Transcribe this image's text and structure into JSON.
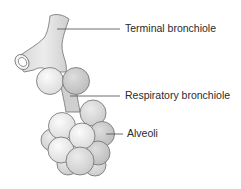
{
  "diagram": {
    "labels": [
      {
        "id": "terminal-bronchiole",
        "text": "Terminal bronchiole"
      },
      {
        "id": "respiratory-bronchiole",
        "text": "Respiratory bronchiole"
      },
      {
        "id": "alveoli",
        "text": "Alveoli"
      }
    ],
    "colors": {
      "outline": "#6e6e6e",
      "fill_light": "#f2f2f2",
      "fill_mid": "#dcdcdc",
      "fill_dark": "#c4c4c4",
      "leader_line": "#4a4a4a",
      "text": "#2a2a2a"
    }
  }
}
